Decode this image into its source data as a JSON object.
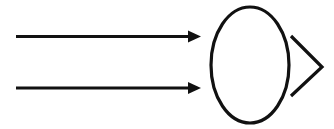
{
  "figure": {
    "background_color": "#ffffff",
    "stroke_color": "#111111",
    "width": 334,
    "height": 129
  },
  "elements": {
    "incoming_arrows": {
      "label": "incoming parallel arrows",
      "count": 2,
      "stroke_width": 3,
      "items": [
        {
          "name": "top-arrow",
          "label": "top incoming arrow",
          "x1": 16,
          "y1": 36.5,
          "x2": 192,
          "y2": 36.5,
          "tip_x": 201,
          "tip_y": 36.5,
          "head_half_height": 6,
          "head_length": 13
        },
        {
          "name": "bottom-arrow",
          "label": "bottom incoming arrow",
          "x1": 16,
          "y1": 88,
          "x2": 192,
          "y2": 88,
          "tip_x": 201,
          "tip_y": 88,
          "head_half_height": 6,
          "head_length": 13
        }
      ]
    },
    "ellipse": {
      "name": "center-ellipse",
      "label": "central ellipse",
      "cx": 250,
      "cy": 65,
      "rx": 39,
      "ry": 58,
      "stroke_width": 3.2,
      "fill": "none"
    },
    "chevron": {
      "name": "right-chevron",
      "label": "open chevron arrowhead pointing right",
      "points": "291,36 322,67 291,96",
      "apex_x": 322,
      "apex_y": 67,
      "top_x": 291,
      "top_y": 36,
      "bottom_x": 291,
      "bottom_y": 96,
      "stroke_width": 3.2,
      "fill": "none"
    }
  }
}
